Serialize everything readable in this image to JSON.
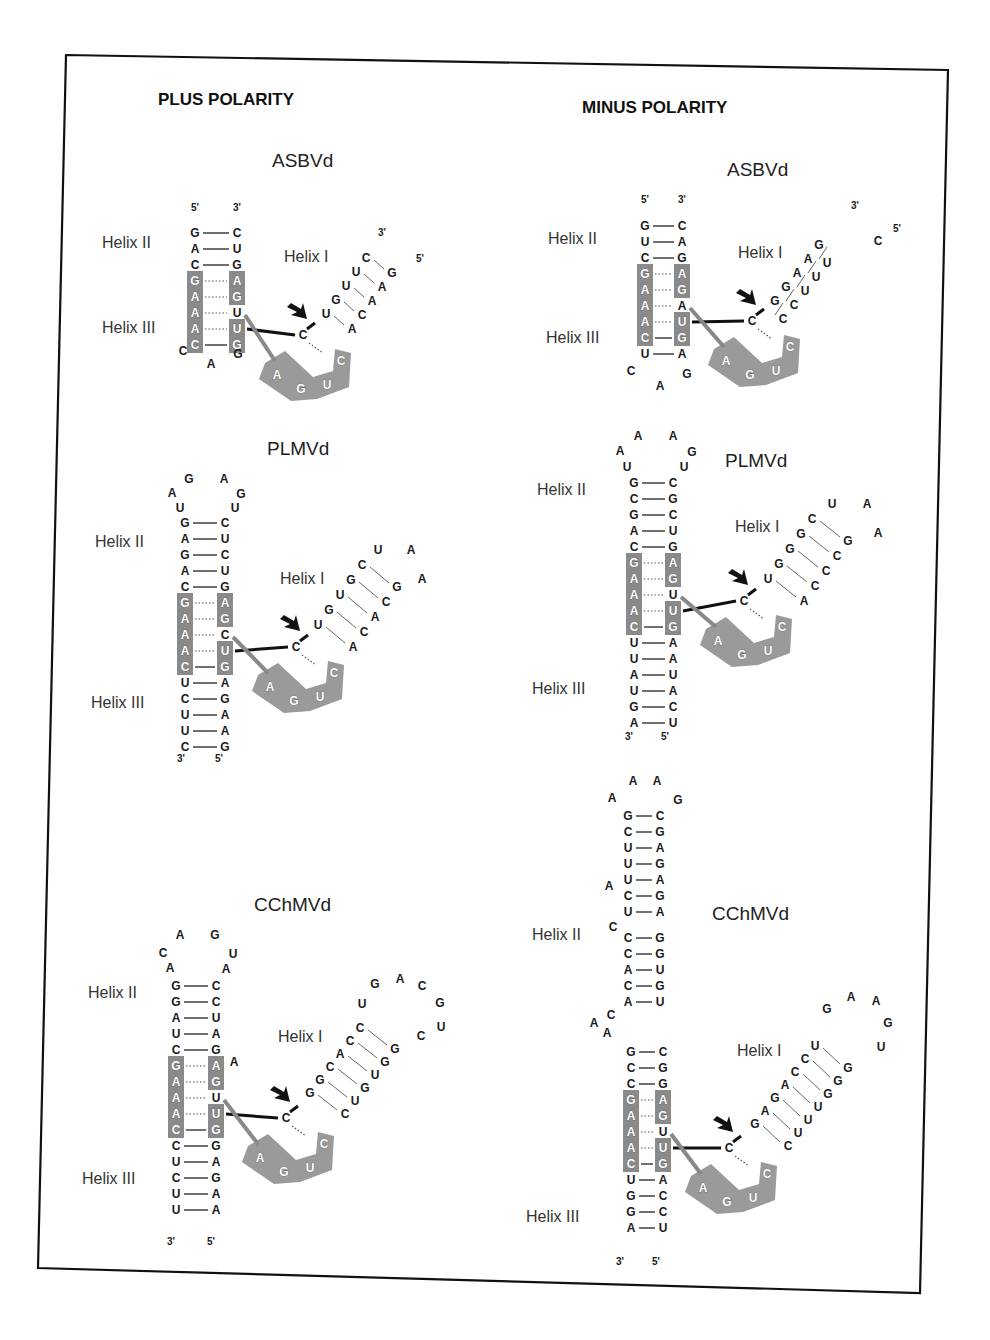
{
  "figure": {
    "columns": [
      {
        "polarity_label": "PLUS POLARITY",
        "panels": [
          {
            "name": "ASBVd",
            "helix_labels": [
              "Helix II",
              "Helix III",
              "Helix I"
            ],
            "helix2_3_left_5to3": [
              "G",
              "A",
              "C",
              "G",
              "A",
              "A",
              "A",
              "C"
            ],
            "helix2_3_right_3to5": [
              "C",
              "U",
              "G",
              "A",
              "G",
              "U",
              "U",
              "G"
            ],
            "loop": [
              "C",
              "A",
              "G"
            ],
            "ends": {
              "left": "5'",
              "right": "3'"
            },
            "helix1_strand_a": [
              "U",
              "G",
              "U",
              "U",
              "C"
            ],
            "helix1_strand_b": [
              "A",
              "C",
              "A",
              "A",
              "G"
            ],
            "helix1_ends": {
              "top_a": "3'",
              "top_b": "5'"
            },
            "cleavage_site": "C",
            "core_box": [
              "A",
              "G",
              "U",
              "C"
            ]
          },
          {
            "name": "PLMVd",
            "helix_labels": [
              "Helix II",
              "Helix III",
              "Helix I"
            ],
            "hairpin_loop": [
              "U",
              "A",
              "G",
              "A",
              "G",
              "U"
            ],
            "helix2_left": [
              "G",
              "A",
              "G",
              "A",
              "C"
            ],
            "helix2_right": [
              "C",
              "U",
              "C",
              "U",
              "G"
            ],
            "core_left": [
              "G",
              "A",
              "A",
              "A",
              "C"
            ],
            "core_right": [
              "A",
              "G",
              "C",
              "U",
              "G"
            ],
            "helix3_left": [
              "U",
              "C",
              "U",
              "U",
              "C"
            ],
            "helix3_right": [
              "A",
              "G",
              "A",
              "A",
              "G"
            ],
            "ends": {
              "left": "3'",
              "right": "5'"
            },
            "helix1_strand_a": [
              "U",
              "G",
              "U",
              "G",
              "C"
            ],
            "helix1_strand_b": [
              "A",
              "C",
              "A",
              "C",
              "G"
            ],
            "helix1_loop": [
              "U",
              "A",
              "A"
            ],
            "cleavage_site": "C",
            "core_box": [
              "A",
              "G",
              "U",
              "C"
            ]
          },
          {
            "name": "CChMVd",
            "helix_labels": [
              "Helix II",
              "Helix III",
              "Helix I"
            ],
            "hairpin_loop": [
              "A",
              "C",
              "A",
              "G",
              "U",
              "A"
            ],
            "helix2_left": [
              "G",
              "G",
              "A",
              "U",
              "C"
            ],
            "helix2_right": [
              "C",
              "C",
              "U",
              "A",
              "G"
            ],
            "bulge": "A",
            "core_left": [
              "G",
              "A",
              "A",
              "A",
              "C"
            ],
            "core_right": [
              "A",
              "G",
              "U",
              "U",
              "G"
            ],
            "helix3_left": [
              "C",
              "U",
              "C",
              "U",
              "U"
            ],
            "helix3_right": [
              "G",
              "A",
              "G",
              "A",
              "A"
            ],
            "ends": {
              "left": "3'",
              "right": "5'"
            },
            "helix1_strand_a": [
              "G",
              "G",
              "C",
              "A",
              "C",
              "C"
            ],
            "helix1_strand_b": [
              "C",
              "U",
              "G",
              "U",
              "G",
              "G"
            ],
            "helix1_loop": [
              "U",
              "G",
              "A",
              "C",
              "G",
              "U",
              "C"
            ],
            "cleavage_site": "C",
            "core_box": [
              "A",
              "G",
              "U",
              "C"
            ]
          }
        ]
      },
      {
        "polarity_label": "MINUS POLARITY",
        "panels": [
          {
            "name": "ASBVd",
            "helix_labels": [
              "Helix II",
              "Helix III",
              "Helix I"
            ],
            "helix2_3_left_5to3": [
              "G",
              "U",
              "C",
              "G",
              "A",
              "A",
              "A",
              "C",
              "U"
            ],
            "helix2_3_right_3to5": [
              "C",
              "A",
              "G",
              "A",
              "G",
              "A",
              "U",
              "G",
              "A"
            ],
            "loop": [
              "C",
              "A",
              "G"
            ],
            "ends": {
              "left": "5'",
              "right": "3'"
            },
            "helix1_strand_a": [
              "G",
              "G",
              "A",
              "A",
              "G"
            ],
            "helix1_strand_b": [
              "C",
              "C",
              "U",
              "U",
              "U",
              "C"
            ],
            "helix1_ends": {
              "top_a": "3'",
              "top_b": "5'"
            },
            "cleavage_site": "C",
            "core_box": [
              "A",
              "G",
              "U",
              "C"
            ]
          },
          {
            "name": "PLMVd",
            "helix_labels": [
              "Helix II",
              "Helix III",
              "Helix I"
            ],
            "hairpin_loop": [
              "U",
              "A",
              "A",
              "A",
              "G",
              "U"
            ],
            "helix2_left": [
              "G",
              "C",
              "G",
              "A",
              "C"
            ],
            "helix2_right": [
              "C",
              "G",
              "C",
              "U",
              "G"
            ],
            "core_left": [
              "G",
              "A",
              "A",
              "A",
              "C"
            ],
            "core_right": [
              "A",
              "G",
              "U",
              "U",
              "G"
            ],
            "helix3_left": [
              "U",
              "U",
              "A",
              "U",
              "G",
              "A"
            ],
            "helix3_right": [
              "A",
              "A",
              "U",
              "A",
              "C",
              "U"
            ],
            "ends": {
              "left": "3'",
              "right": "5'"
            },
            "helix1_strand_a": [
              "U",
              "G",
              "G",
              "G",
              "C"
            ],
            "helix1_strand_b": [
              "A",
              "C",
              "C",
              "C",
              "G"
            ],
            "helix1_loop": [
              "U",
              "A",
              "A"
            ],
            "cleavage_site": "C",
            "core_box": [
              "A",
              "G",
              "U",
              "C"
            ]
          },
          {
            "name": "CChMVd",
            "helix_labels": [
              "Helix II",
              "Helix III",
              "Helix I"
            ],
            "hairpin_loop": [
              "A",
              "A",
              "A",
              "G"
            ],
            "helix2_upper_left": [
              "G",
              "C",
              "U",
              "U",
              "U"
            ],
            "helix2_upper_right": [
              "C",
              "G",
              "A",
              "G",
              "A"
            ],
            "bulge1": "A",
            "helix2_mid_left": [
              "C",
              "U"
            ],
            "helix2_mid_right": [
              "G",
              "A"
            ],
            "bulge2": "C",
            "helix2_lower_left": [
              "C",
              "C",
              "A",
              "C",
              "A"
            ],
            "helix2_lower_right": [
              "G",
              "G",
              "U",
              "G",
              "U"
            ],
            "interior_loop": [
              "C",
              "A",
              "A"
            ],
            "helix2_base_left": [
              "G",
              "C",
              "C"
            ],
            "helix2_base_right": [
              "C",
              "G",
              "G"
            ],
            "core_left": [
              "G",
              "A",
              "A",
              "A",
              "C"
            ],
            "core_right": [
              "A",
              "G",
              "U",
              "U",
              "G"
            ],
            "helix3_left": [
              "U",
              "G",
              "G",
              "A"
            ],
            "helix3_right": [
              "A",
              "C",
              "C",
              "U"
            ],
            "ends": {
              "left": "3'",
              "right": "5'"
            },
            "helix1_strand_a": [
              "G",
              "A",
              "G",
              "A",
              "C",
              "C",
              "U"
            ],
            "helix1_strand_b": [
              "C",
              "U",
              "U",
              "U",
              "G",
              "G",
              "G"
            ],
            "helix1_loop": [
              "G",
              "A",
              "A",
              "G",
              "U"
            ],
            "cleavage_site": "C",
            "core_box": [
              "A",
              "G",
              "U",
              "C"
            ]
          }
        ]
      }
    ]
  }
}
